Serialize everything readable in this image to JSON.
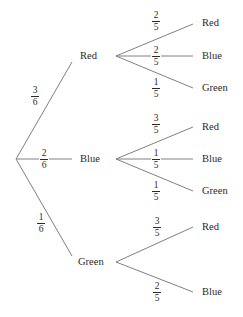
{
  "tree": {
    "root": {
      "branches": [
        {
          "label": "Red",
          "prob": {
            "num": "3",
            "den": "6"
          },
          "children": [
            {
              "label": "Red",
              "prob": {
                "num": "2",
                "den": "5"
              }
            },
            {
              "label": "Blue",
              "prob": {
                "num": "2",
                "den": "5"
              }
            },
            {
              "label": "Green",
              "prob": {
                "num": "1",
                "den": "5"
              }
            }
          ]
        },
        {
          "label": "Blue",
          "prob": {
            "num": "2",
            "den": "6"
          },
          "children": [
            {
              "label": "Red",
              "prob": {
                "num": "3",
                "den": "5"
              }
            },
            {
              "label": "Blue",
              "prob": {
                "num": "1",
                "den": "5"
              }
            },
            {
              "label": "Green",
              "prob": {
                "num": "1",
                "den": "5"
              }
            }
          ]
        },
        {
          "label": "Green",
          "prob": {
            "num": "1",
            "den": "6"
          },
          "children": [
            {
              "label": "Red",
              "prob": {
                "num": "3",
                "den": "5"
              }
            },
            {
              "label": "Blue",
              "prob": {
                "num": "2",
                "den": "5"
              }
            }
          ]
        }
      ]
    },
    "line_color": "#808080"
  }
}
